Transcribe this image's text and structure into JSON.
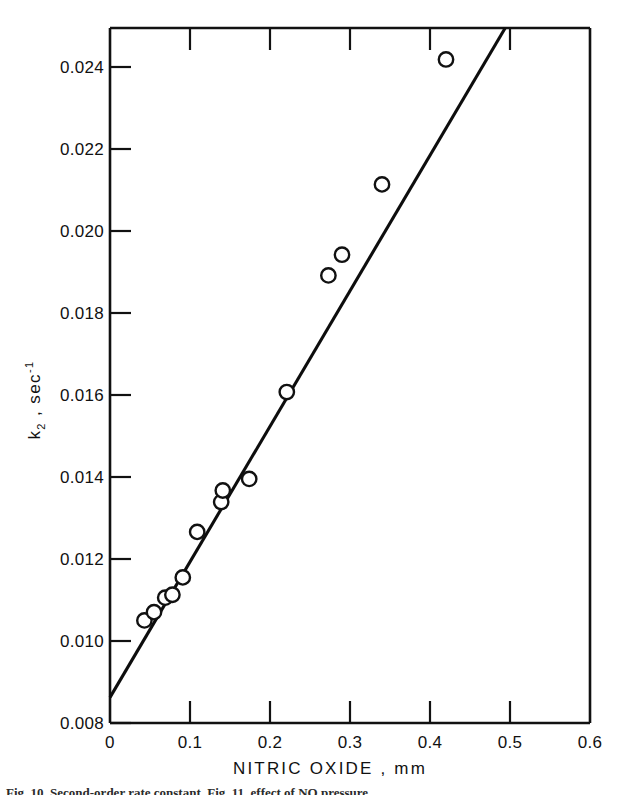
{
  "figure": {
    "background_color": "#ffffff",
    "ink_color": "#111111",
    "caption": "Fig. 10. Second-order rate constant. Fig. 11. effect of NO pressure"
  },
  "chart_data": {
    "type": "scatter",
    "title": "",
    "subtitle": "",
    "xlabel": "NITRIC OXIDE ,   mm",
    "ylabel": "k2 , sec-1",
    "ylabel_parts": {
      "base": "k",
      "subscript": "2",
      "separator": " ,  sec",
      "superscript": "-1"
    },
    "xlim": [
      0,
      0.6
    ],
    "ylim": [
      0.008,
      0.0248
    ],
    "grid": false,
    "legend": false,
    "legend_position": "none",
    "xticks": [
      0,
      0.1,
      0.2,
      0.3,
      0.4,
      0.5,
      0.6
    ],
    "xticklabels": [
      "0",
      "0.1",
      "0.2",
      "0.3",
      "0.4",
      "0.5",
      "0.6"
    ],
    "yticks": [
      0.008,
      0.01,
      0.012,
      0.014,
      0.016,
      0.018,
      0.02,
      0.022,
      0.024
    ],
    "yticklabels": [
      "0.008",
      "0.010",
      "0.012",
      "0.014",
      "0.016",
      "0.018",
      "0.020",
      "0.022",
      "0.024"
    ],
    "marker_style": "open-circle",
    "series": [
      {
        "name": "k2 vs nitric oxide pressure",
        "x": [
          0.043,
          0.055,
          0.069,
          0.078,
          0.091,
          0.109,
          0.139,
          0.141,
          0.174,
          0.221,
          0.273,
          0.29,
          0.34,
          0.42
        ],
        "y": [
          0.01048,
          0.01068,
          0.01103,
          0.0111,
          0.01152,
          0.01262,
          0.01334,
          0.01362,
          0.0139,
          0.016,
          0.01882,
          0.01932,
          0.02102,
          0.02404
        ]
      }
    ],
    "fit_line": {
      "name": "least-squares line",
      "x": [
        0.0,
        0.494
      ],
      "y": [
        0.00862,
        0.0248
      ],
      "intercept": 0.00862,
      "slope": 0.0327
    }
  }
}
